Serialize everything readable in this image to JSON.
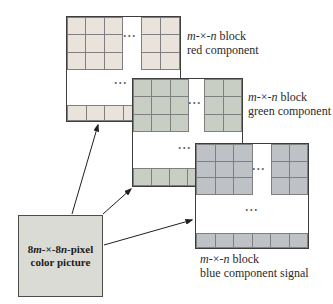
{
  "figure": {
    "ellipsis": "...",
    "block_label": {
      "m": "m",
      "times": "-×-",
      "n": "n",
      "suffix": " block"
    },
    "components": [
      {
        "key": "red",
        "line2": "red component",
        "cell_color": "#eae3dc"
      },
      {
        "key": "green",
        "line2": "green component",
        "cell_color": "#c9cec5"
      },
      {
        "key": "blue",
        "line2": "blue component signal",
        "cell_color": "#bec2c6"
      }
    ],
    "source_box": {
      "line1": {
        "p1": "8",
        "m": "m",
        "times": "-×-",
        "p2": "8",
        "n": "n",
        "suffix": "-pixel"
      },
      "line2": "color picture",
      "fill": "#dbdbd5",
      "border_color": "#4c4c4c"
    },
    "line_color": "#1f1f1f"
  }
}
